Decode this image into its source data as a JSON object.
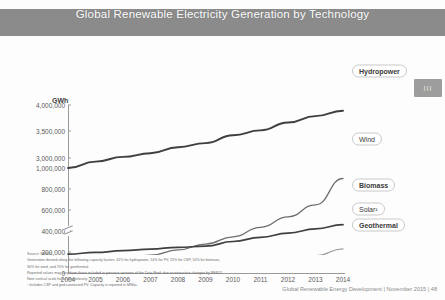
{
  "header": {
    "title": "Global Renewable Electricity Generation by Technology"
  },
  "badge": {
    "glyph": "III"
  },
  "chart_data": {
    "type": "line",
    "title": "Global Renewable Electricity Generation by Technology",
    "xlabel": "",
    "ylabel": "GWh",
    "yunit": "GWh",
    "grid": false,
    "legend_position": "right-inline",
    "axis_break": {
      "between": [
        1000000,
        3000000
      ],
      "marker": "double-slash"
    },
    "categories": [
      "2004",
      "2005",
      "2006",
      "2007",
      "2008",
      "2009",
      "2010",
      "2011",
      "2012",
      "2013",
      "2014"
    ],
    "x": [
      2004,
      2005,
      2006,
      2007,
      2008,
      2009,
      2010,
      2011,
      2012,
      2013,
      2014
    ],
    "ytick_labels": [
      "0",
      "200,000",
      "400,000",
      "600,000",
      "800,000",
      "1,000,000",
      "3,000,000",
      "3,500,000",
      "4,000,000"
    ],
    "ytick_values": [
      0,
      200000,
      400000,
      600000,
      800000,
      1000000,
      3000000,
      3500000,
      4000000
    ],
    "ylim": [
      0,
      4000000
    ],
    "series": [
      {
        "name": "Hydropower",
        "values": [
          2810000,
          2930000,
          3020000,
          3090000,
          3200000,
          3280000,
          3430000,
          3520000,
          3670000,
          3790000,
          3890000
        ]
      },
      {
        "name": "Wind",
        "values": [
          85000,
          105000,
          133000,
          170000,
          220000,
          275000,
          345000,
          435000,
          535000,
          650000,
          900000
        ]
      },
      {
        "name": "Biomass",
        "values": [
          180000,
          196000,
          212000,
          228000,
          245000,
          255000,
          300000,
          340000,
          380000,
          420000,
          460000
        ]
      },
      {
        "name": "Solar",
        "values": [
          5000,
          6000,
          8000,
          10000,
          14000,
          22000,
          35000,
          70000,
          110000,
          165000,
          230000
        ]
      },
      {
        "name": "Geothermal",
        "values": [
          55000,
          57000,
          59000,
          61000,
          63000,
          65000,
          67000,
          69000,
          71000,
          73000,
          75000
        ]
      }
    ],
    "series_labels": [
      {
        "label": "Hydropower",
        "emphasis": true
      },
      {
        "label": "Wind",
        "emphasis": false
      },
      {
        "label": "Biomass",
        "emphasis": true
      },
      {
        "label": "Solar¹",
        "emphasis": false
      },
      {
        "label": "Geothermal",
        "emphasis": true
      }
    ]
  },
  "footnotes": [
    "Source: REN21",
    "Generation derived along the following capacity factors: 41% for hydropower, 14% for PV, 25% for CSP, 54% for biomass,",
    "30% for wind, and 70% for geothermal.",
    "Reported values may vary from those included in previous versions of the Data Book due to retroactive changes by REN21.",
    "Note vertical scale has a discontinuity.",
    "¹ Includes CSP and grid-connected PV. Capacity is reported in MWac."
  ],
  "footer": {
    "text": "Global Renewable Energy Development  |  November 2015  |  48"
  }
}
